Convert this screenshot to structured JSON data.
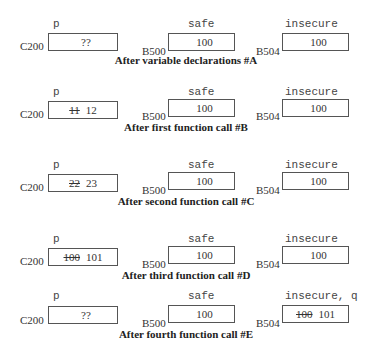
{
  "panels": [
    {
      "caption": "After variable declarations #A",
      "cells": [
        {
          "label": "p",
          "address": "C200",
          "old": "",
          "value": "??"
        },
        {
          "label": "safe",
          "address": "B500",
          "old": "",
          "value": "100"
        },
        {
          "label": "insecure",
          "address": "B504",
          "old": "",
          "value": "100"
        }
      ]
    },
    {
      "caption": "After first function call #B",
      "cells": [
        {
          "label": "p",
          "address": "C200",
          "old": "11",
          "value": "12"
        },
        {
          "label": "safe",
          "address": "B500",
          "old": "",
          "value": "100"
        },
        {
          "label": "insecure",
          "address": "B504",
          "old": "",
          "value": "100"
        }
      ]
    },
    {
      "caption": "After second function call #C",
      "cells": [
        {
          "label": "p",
          "address": "C200",
          "old": "22",
          "value": "23"
        },
        {
          "label": "safe",
          "address": "B500",
          "old": "",
          "value": "100"
        },
        {
          "label": "insecure",
          "address": "B504",
          "old": "",
          "value": "100"
        }
      ]
    },
    {
      "caption": "After third function call #D",
      "cells": [
        {
          "label": "p",
          "address": "C200",
          "old": "100",
          "value": "101"
        },
        {
          "label": "safe",
          "address": "B500",
          "old": "",
          "value": "100"
        },
        {
          "label": "insecure",
          "address": "B504",
          "old": "",
          "value": "100"
        }
      ]
    },
    {
      "caption": "After fourth function call #E",
      "cells": [
        {
          "label": "p",
          "address": "C200",
          "old": "",
          "value": "??"
        },
        {
          "label": "safe",
          "address": "B500",
          "old": "",
          "value": "100"
        },
        {
          "label": "insecure, q",
          "address": "B504",
          "old": "100",
          "value": "101"
        }
      ]
    }
  ]
}
